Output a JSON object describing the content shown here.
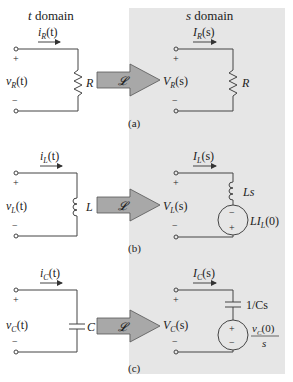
{
  "headers": {
    "t_domain": "t domain",
    "s_domain": "s domain"
  },
  "colors": {
    "panel": "#e6e6e6",
    "arrow": "#a8a8a8",
    "wire": "#444444"
  },
  "transform_symbol": "𝓛",
  "panels": [
    {
      "caption": "(a)",
      "element": "resistor",
      "t": {
        "current": "i",
        "current_sub": "R",
        "current_arg": "(t)",
        "voltage": "v",
        "voltage_sub": "R",
        "voltage_arg": "(t)",
        "component": "R"
      },
      "s": {
        "current": "I",
        "current_sub": "R",
        "current_arg": "(s)",
        "voltage": "V",
        "voltage_sub": "R",
        "voltage_arg": "(s)",
        "component": "R"
      }
    },
    {
      "caption": "(b)",
      "element": "inductor",
      "t": {
        "current": "i",
        "current_sub": "L",
        "current_arg": "(t)",
        "voltage": "v",
        "voltage_sub": "L",
        "voltage_arg": "(t)",
        "component": "L"
      },
      "s": {
        "current": "I",
        "current_sub": "L",
        "current_arg": "(s)",
        "voltage": "V",
        "voltage_sub": "L",
        "voltage_arg": "(s)",
        "component": "Ls",
        "source": "LI",
        "source_sub": "L",
        "source_arg": "(0)"
      }
    },
    {
      "caption": "(c)",
      "element": "capacitor",
      "t": {
        "current": "i",
        "current_sub": "C",
        "current_arg": "(t)",
        "voltage": "v",
        "voltage_sub": "C",
        "voltage_arg": "(t)",
        "component": "C"
      },
      "s": {
        "current": "I",
        "current_sub": "C",
        "current_arg": "(s)",
        "voltage": "V",
        "voltage_sub": "C",
        "voltage_arg": "(s)",
        "component": "1/Cs",
        "source_num": "v",
        "source_num_sub": "C",
        "source_num_arg": "(0)",
        "source_den": "s"
      }
    }
  ],
  "polarity": {
    "plus": "+",
    "minus": "−"
  }
}
